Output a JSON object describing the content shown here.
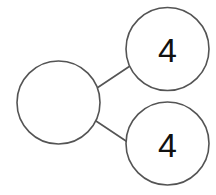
{
  "diagram": {
    "type": "number-bond",
    "background_color": "#ffffff",
    "stroke_color": "#545454",
    "text_color": "#111111",
    "nodes": [
      {
        "id": "whole",
        "role": "whole",
        "label": "",
        "filled": false,
        "cx": 58.5,
        "cy": 102.5,
        "r": 41.5
      },
      {
        "id": "part-top",
        "role": "part",
        "label": "4",
        "filled": true,
        "cx": 167.5,
        "cy": 49,
        "r": 41.5
      },
      {
        "id": "part-bottom",
        "role": "part",
        "label": "4",
        "filled": true,
        "cx": 167.5,
        "cy": 143.5,
        "r": 41.5
      }
    ],
    "links": [
      {
        "id": "link-whole-top",
        "from": "whole",
        "to": "part-top",
        "x1": 97,
        "y1": 88,
        "x2": 130,
        "y2": 66
      },
      {
        "id": "link-whole-bottom",
        "from": "whole",
        "to": "part-bottom",
        "x1": 96,
        "y1": 121,
        "x2": 132,
        "y2": 145
      }
    ]
  }
}
